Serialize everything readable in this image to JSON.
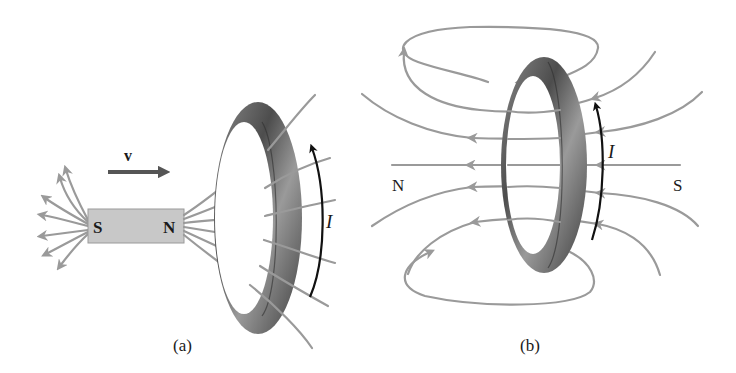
{
  "figure": {
    "panels": [
      {
        "id": "a",
        "caption": "(a)",
        "velocity_label": "v",
        "magnet": {
          "south_label": "S",
          "north_label": "N"
        },
        "current_label": "I"
      },
      {
        "id": "b",
        "caption": "(b)",
        "left_pole_label": "N",
        "right_pole_label": "S",
        "current_label": "I"
      }
    ],
    "colors": {
      "field_lines": "#9a9a9a",
      "ring_dark": "#4a4a4a",
      "ring_mid": "#7a7a7a",
      "ring_light": "#a8a8a8",
      "magnet_fill": "#c8c8c8",
      "velocity_arrow": "#555555",
      "current_arrow": "#111111",
      "text": "#1a1a1a"
    }
  }
}
